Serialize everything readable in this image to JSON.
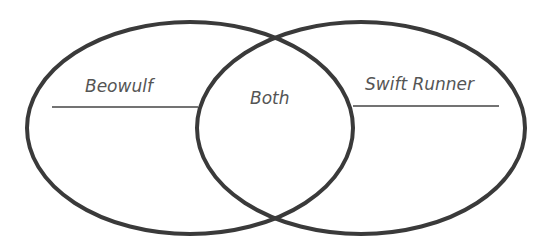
{
  "diagram": {
    "type": "venn",
    "stroke_color": "#3a3a3a",
    "text_color": "#555555",
    "sets": [
      {
        "id": "left",
        "label": "Beowulf"
      },
      {
        "id": "right",
        "label": "Swift Runner"
      }
    ],
    "intersection": {
      "label": "Both"
    }
  }
}
